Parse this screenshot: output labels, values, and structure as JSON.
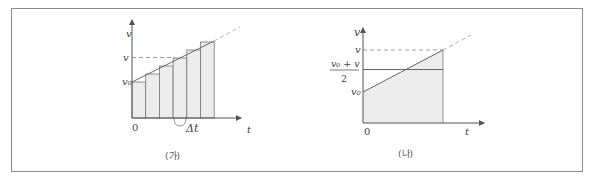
{
  "figure": {
    "panels": [
      {
        "caption": "(가)",
        "y_axis_label": "v",
        "x_axis_label": "t",
        "origin_label": "0",
        "y_ticks": [
          "v",
          "v₀"
        ],
        "annotation": "Δt",
        "description": "Velocity-time graph approximated by 6 rectangular strips of width Δt under a linearly increasing line"
      },
      {
        "caption": "(나)",
        "y_axis_label": "v",
        "x_axis_label": "t",
        "origin_label": "0",
        "y_ticks": [
          "v",
          "v₀"
        ],
        "mean_label_numerator": "v₀ + v",
        "mean_label_denominator": "2",
        "description": "Velocity-time graph with shaded trapezoid area and horizontal average-velocity line (v₀+v)/2"
      }
    ],
    "colors": {
      "axis": "#555555",
      "line": "#666666",
      "fill": "#ececec",
      "dashed": "#888888",
      "border": "#8a8a8a"
    }
  }
}
